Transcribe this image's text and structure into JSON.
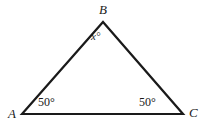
{
  "figure": {
    "type": "geometry-diagram",
    "shape": "triangle",
    "background_color": "#ffffff",
    "stroke_color": "#1a1a1a",
    "stroke_width": 2.2,
    "vertices": [
      {
        "name": "A",
        "label": "A",
        "x": 22,
        "y": 114
      },
      {
        "name": "B",
        "label": "B",
        "x": 103,
        "y": 22
      },
      {
        "name": "C",
        "label": "C",
        "x": 183,
        "y": 114
      }
    ],
    "angles": [
      {
        "at": "A",
        "label": "50°",
        "value": 50,
        "unit": "degrees"
      },
      {
        "at": "B",
        "label": "x°",
        "value": null,
        "unit": "degrees",
        "variable": "x"
      },
      {
        "at": "C",
        "label": "50°",
        "value": 50,
        "unit": "degrees"
      }
    ],
    "edges": [
      {
        "from": "A",
        "to": "B"
      },
      {
        "from": "B",
        "to": "C"
      },
      {
        "from": "C",
        "to": "A"
      }
    ]
  }
}
